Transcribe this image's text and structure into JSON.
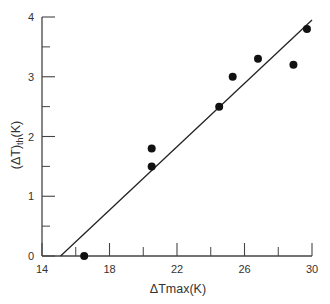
{
  "chart_data": {
    "type": "scatter",
    "title": "",
    "xlabel": "ΔTmax(K)",
    "ylabel": "(ΔT)th(K)",
    "ylabel_main": "(ΔT)",
    "ylabel_sub": "th",
    "ylabel_tail": "(K)",
    "xlim": [
      14,
      30
    ],
    "ylim": [
      0,
      4
    ],
    "x_ticks": [
      14,
      18,
      22,
      26,
      30
    ],
    "x_minor_ticks": [
      16,
      20,
      24,
      28
    ],
    "y_ticks": [
      0,
      1,
      2,
      3,
      4
    ],
    "y_minor_ticks": [
      0.5,
      1.5,
      2.5,
      3.5
    ],
    "grid": false,
    "legend": null,
    "series": [
      {
        "name": "data",
        "x": [
          16.5,
          20.5,
          20.5,
          24.5,
          25.3,
          26.8,
          28.9,
          29.7
        ],
        "y": [
          0.0,
          1.8,
          1.5,
          2.5,
          3.0,
          3.3,
          3.2,
          3.8
        ]
      }
    ],
    "fit_line": {
      "x": [
        15.1,
        30.0
      ],
      "y": [
        0.0,
        3.95
      ]
    }
  },
  "colors": {
    "axis": "#444444",
    "marker": "#111111",
    "line": "#222222"
  }
}
